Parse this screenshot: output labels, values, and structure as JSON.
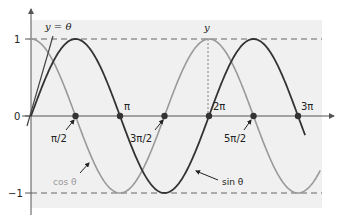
{
  "chart_data": {
    "type": "line",
    "title": "",
    "xlabel": "θ",
    "ylabel": "y",
    "xlim": [
      0,
      3.3
    ],
    "ylim": [
      -1.2,
      1.3
    ],
    "x_ticks": [
      {
        "value": 0.5,
        "label": "π/2",
        "position": "below"
      },
      {
        "value": 1.0,
        "label": "π",
        "position": "above"
      },
      {
        "value": 1.5,
        "label": "3π/2",
        "position": "below"
      },
      {
        "value": 2.0,
        "label": "2π",
        "position": "above"
      },
      {
        "value": 2.5,
        "label": "5π/2",
        "position": "below"
      },
      {
        "value": 3.0,
        "label": "3π",
        "position": "above"
      }
    ],
    "y_ticks": [
      {
        "value": 1,
        "label": "1"
      },
      {
        "value": 0,
        "label": "0"
      },
      {
        "value": -1,
        "label": "−1"
      }
    ],
    "x_unit": "π",
    "series": [
      {
        "name": "sin θ",
        "function": "sin",
        "color": "#333333",
        "x_range_pi": [
          0,
          3.08
        ]
      },
      {
        "name": "cos θ",
        "function": "cos",
        "color": "#999999",
        "x_range_pi": [
          -0.03,
          3.25
        ]
      },
      {
        "name": "y = θ",
        "function": "identity",
        "color": "#444444",
        "x_range_pi": [
          0,
          0.255
        ]
      }
    ],
    "marked_points": [
      0.5,
      1.0,
      1.5,
      2.0,
      2.5,
      3.0
    ],
    "reference_lines": [
      {
        "type": "horizontal",
        "y": 1,
        "style": "dashed"
      },
      {
        "type": "horizontal",
        "y": -1,
        "style": "dashed"
      },
      {
        "type": "vertical",
        "x_pi": 2.0,
        "from_y": 0,
        "to_y": 1,
        "style": "dotted",
        "label": "y"
      }
    ],
    "annotations": [
      {
        "text": "y = θ",
        "target": "line y=θ"
      },
      {
        "text": "cos θ",
        "target": "cos curve"
      },
      {
        "text": "sin θ",
        "target": "sin curve"
      }
    ],
    "grid": false,
    "legend": "none",
    "background": "#f0f0f0"
  },
  "labels": {
    "y_eq_theta": "y = θ",
    "cos": "cos θ",
    "sin": "sin θ",
    "y_axis": "y",
    "y1": "1",
    "y0": "0",
    "ym1": "−1",
    "pi_half": "π/2",
    "pi": "π",
    "three_pi_half": "3π/2",
    "two_pi": "2π",
    "five_pi_half": "5π/2",
    "three_pi": "3π"
  }
}
